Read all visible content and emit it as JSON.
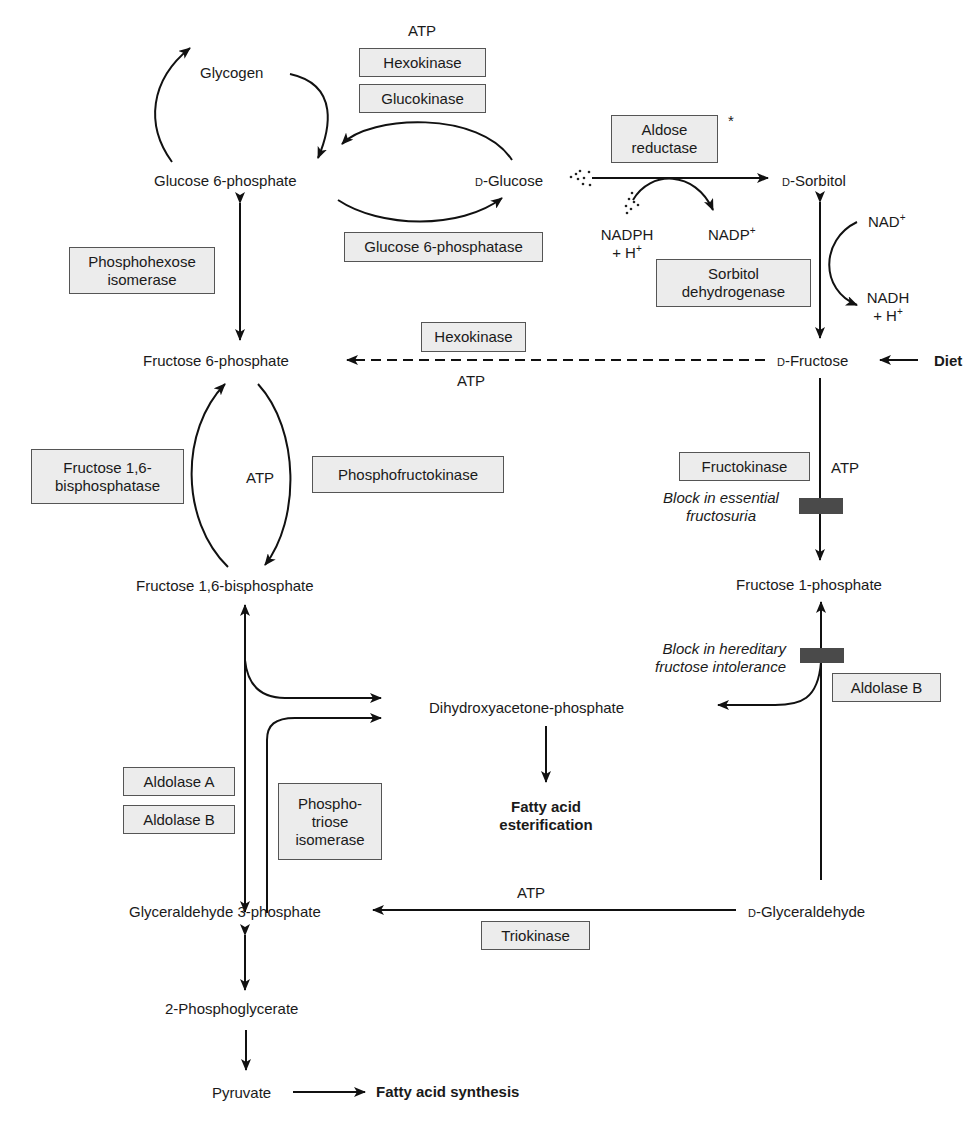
{
  "metabolites": {
    "glycogen": "Glycogen",
    "glucose6p": "Glucose 6-phosphate",
    "d_glucose_prefix": "D",
    "d_glucose": "-Glucose",
    "d_sorbitol_prefix": "D",
    "d_sorbitol": "-Sorbitol",
    "fructose6p": "Fructose 6-phosphate",
    "d_fructose_prefix": "D",
    "d_fructose": "-Fructose",
    "fructose16bp": "Fructose 1,6-bisphosphate",
    "fructose1p": "Fructose 1-phosphate",
    "dhap": "Dihydroxyacetone-phosphate",
    "g3p": "Glyceraldehyde 3-phosphate",
    "d_glyceraldehyde_prefix": "D",
    "d_glyceraldehyde": "-Glyceraldehyde",
    "phosphoglycerate": "2-Phosphoglycerate",
    "pyruvate": "Pyruvate"
  },
  "outcomes": {
    "diet": "Diet",
    "fa_esterification_line1": "Fatty acid",
    "fa_esterification_line2": "esterification",
    "fa_synthesis": "Fatty acid synthesis"
  },
  "enzymes": {
    "hexokinase_top": "Hexokinase",
    "glucokinase": "Glucokinase",
    "aldose_reductase_line1": "Aldose",
    "aldose_reductase_line2": "reductase",
    "aldose_reductase_mark": "*",
    "glucose6phosphatase": "Glucose 6-phosphatase",
    "phosphohexose_line1": "Phosphohexose",
    "phosphohexose_line2": "isomerase",
    "sorbitol_dh_line1": "Sorbitol",
    "sorbitol_dh_line2": "dehydrogenase",
    "hexokinase_mid": "Hexokinase",
    "fbpase_line1": "Fructose 1,6-",
    "fbpase_line2": "bisphosphatase",
    "pfk": "Phosphofructokinase",
    "fructokinase": "Fructokinase",
    "aldolase_b_right": "Aldolase B",
    "aldolase_a": "Aldolase A",
    "aldolase_b_left": "Aldolase B",
    "tpi_line1": "Phospho-",
    "tpi_line2": "triose",
    "tpi_line3": "isomerase",
    "triokinase": "Triokinase"
  },
  "cofactors": {
    "atp_top": "ATP",
    "atp_hexokinase": "ATP",
    "atp_pfk": "ATP",
    "atp_fructokinase": "ATP",
    "atp_triokinase": "ATP",
    "nadph": "NADPH",
    "nadph_h": "+ H",
    "nadp": "NADP",
    "nad": "NAD",
    "nadh": "NADH",
    "nadh_h": "+ H",
    "plus": "+"
  },
  "blocks": {
    "essential_line1": "Block in essential",
    "essential_line2": "fructosuria",
    "hereditary_line1": "Block in hereditary",
    "hereditary_line2": "fructose intolerance"
  },
  "colors": {
    "enzyme_box_fill": "#ececec",
    "enzyme_box_border": "#555555",
    "block_bar": "#4a4a4a",
    "arrow": "#111111"
  }
}
